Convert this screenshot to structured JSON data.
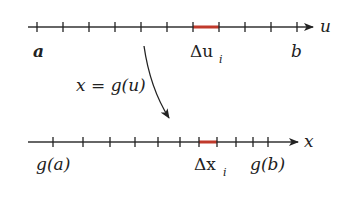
{
  "diagram": {
    "colors": {
      "axis": "#333333",
      "tick": "#222222",
      "highlight": "#c0392b",
      "text": "#222222"
    },
    "top_axis": {
      "variable_label": "u",
      "y": 27,
      "x_start": 28,
      "arrow_tip_x": 313,
      "ticks_x": [
        37,
        63,
        89,
        115,
        141,
        167,
        193,
        219,
        245,
        271,
        297
      ],
      "highlight_segment": {
        "from_x": 193,
        "to_x": 219
      },
      "labels": {
        "left_end": "a",
        "right_end": "b",
        "delta_main": "Δu",
        "delta_sub": "i"
      }
    },
    "bottom_axis": {
      "variable_label": "x",
      "y": 142,
      "x_start": 28,
      "arrow_tip_x": 298,
      "ticks_x": [
        53,
        83,
        110,
        135,
        158,
        180,
        199,
        217,
        236,
        253,
        268
      ],
      "highlight_segment": {
        "from_x": 199,
        "to_x": 217
      },
      "labels": {
        "left_end": "g(a)",
        "right_end": "g(b)",
        "delta_main": "Δx",
        "delta_sub": "i"
      }
    },
    "mapping": {
      "label": "x = g(u)",
      "arrow_start": [
        144,
        46
      ],
      "arrow_end": [
        169,
        118
      ]
    }
  }
}
